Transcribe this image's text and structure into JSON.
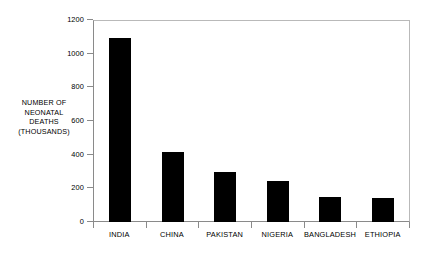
{
  "chart_data": {
    "type": "bar",
    "title": "",
    "subtitle": "",
    "xlabel": "",
    "ylabel": "NUMBER OF NEONATAL DEATHS (THOUSANDS)",
    "ylabel_lines": [
      "NUMBER OF",
      "NEONATAL",
      "DEATHS",
      "(THOUSANDS)"
    ],
    "categories": [
      "INDIA",
      "CHINA",
      "PAKISTAN",
      "NIGERIA",
      "BANGLADESH",
      "ETHIOPIA"
    ],
    "values": [
      1100,
      420,
      300,
      245,
      150,
      143
    ],
    "ylim": [
      0,
      1200
    ],
    "ytick_labels": [
      "0",
      "200",
      "400",
      "600",
      "800",
      "1000",
      "1200"
    ],
    "ytick_values": [
      0,
      200,
      400,
      600,
      800,
      1000,
      1200
    ],
    "grid": false,
    "legend": null,
    "bar_color": "#000000",
    "axis_color": "#8a8a8a",
    "frame_color": "#b9b9b9",
    "background": "#ffffff"
  }
}
